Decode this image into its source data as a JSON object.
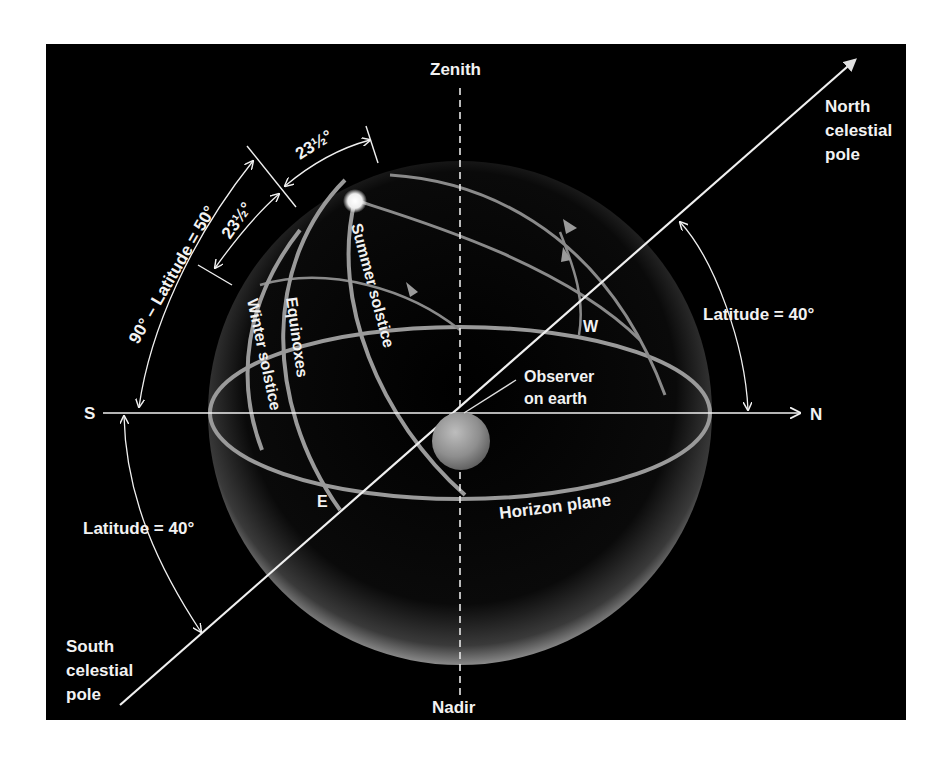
{
  "diagram": {
    "background_color": "#000000",
    "line_color": "#f0f0f0",
    "circle_color": "#9a9a9a",
    "labels": {
      "zenith": "Zenith",
      "nadir": "Nadir",
      "south": "S",
      "north": "N",
      "east": "E",
      "west": "W",
      "north_pole": [
        "North",
        "celestial",
        "pole"
      ],
      "south_pole": [
        "South",
        "celestial",
        "pole"
      ],
      "observer": [
        "Observer",
        "on earth"
      ],
      "horizon": "Horizon plane",
      "summer": "Summer solstice",
      "equinoxes": "Equinoxes",
      "winter": "Winter solstice",
      "lat_right": "Latitude = 40°",
      "lat_left": "Latitude = 40°",
      "colatitude": "90° – Latitude = 50°",
      "tilt_upper": "23½°",
      "tilt_lower": "23½°"
    }
  }
}
